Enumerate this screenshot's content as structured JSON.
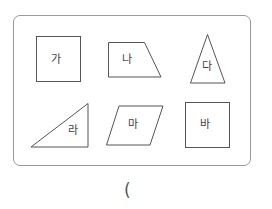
{
  "figures": [
    {
      "id": "ga",
      "label": "가",
      "shape": "square"
    },
    {
      "id": "na",
      "label": "나",
      "shape": "trapezoid"
    },
    {
      "id": "da",
      "label": "다",
      "shape": "triangle"
    },
    {
      "id": "ra",
      "label": "라",
      "shape": "right-triangle"
    },
    {
      "id": "ma",
      "label": "마",
      "shape": "parallelogram"
    },
    {
      "id": "ba",
      "label": "바",
      "shape": "square"
    }
  ],
  "answer": {
    "open_paren": "("
  },
  "colors": {
    "stroke": "#555555",
    "frame": "#9a9a9a"
  }
}
